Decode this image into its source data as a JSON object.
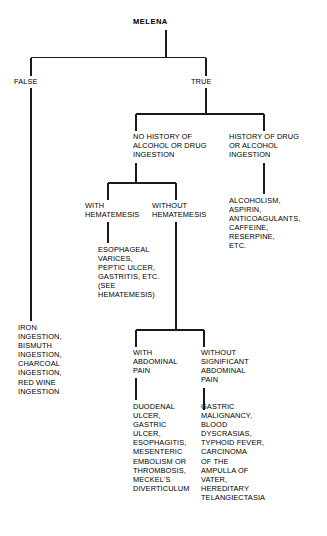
{
  "diagram": {
    "title": "MELENA",
    "type": "decision-tree-flowchart",
    "line_color": "#1a1a1a",
    "text_color": "#000000",
    "background_color": "#ffffff",
    "nodes": {
      "root": "MELENA",
      "branch_false": "FALSE",
      "branch_true": "TRUE",
      "false_outcome": "IRON\nINGESTION,\nBISMUTH\nINGESTION,\nCHARCOAL\nINGESTION,\nRED WINE\nINGESTION",
      "no_history": "NO HISTORY OF\nALCOHOL OR DRUG\nINGESTION",
      "history": "HISTORY OF DRUG\nOR ALCOHOL\nINGESTION",
      "history_outcome": "ALCOHOLISM,\nASPIRIN,\nANTICOAGULANTS,\nCAFFEINE,\nRESERPINE,\nETC.",
      "with_hematemesis": "WITH\nHEMATEMESIS",
      "without_hematemesis": "WITHOUT\nHEMATEMESIS",
      "with_hematemesis_outcome": "ESOPHAGEAL\nVARICES,\nPEPTIC ULCER,\nGASTRITIS, ETC.\n(SEE\nHEMATEMESIS)",
      "with_abdominal_pain": "WITH\nABDOMINAL\nPAIN",
      "without_abdominal_pain": "WITHOUT\nSIGNIFICANT\nABDOMINAL\nPAIN",
      "with_abdominal_pain_outcome": "DUODENAL\nULCER,\nGASTRIC\nULCER,\nESOPHAGITIS,\nMESENTERIC\nEMBOLISM OR\nTHROMBOSIS,\nMECKEL'S\nDIVERTICULUM",
      "without_abdominal_pain_outcome": "GASTRIC\nMALIGNANCY,\nBLOOD\nDYSCRASIAS,\nTYPHOID FEVER,\nCARCINOMA\nOF THE\nAMPULLA OF\nVATER,\nHEREDITARY\nTELANGIECTASIA"
    }
  }
}
